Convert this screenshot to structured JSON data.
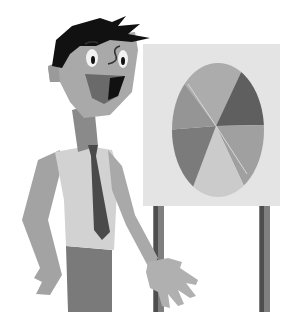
{
  "scene": {
    "description": "Cartoon businessman presenting a pie chart on an easel board",
    "style": "grayscale flat illustration"
  },
  "colors": {
    "background": "#ffffff",
    "hair": "#111111",
    "skin": "#a9a9a9",
    "mouth": "#6a6a6a",
    "tongue": "#8c8c8c",
    "neck": "#8a8a8a",
    "shirt": "#d2d2d2",
    "tie": "#4a4a4a",
    "pants": "#7a7a7a",
    "board": "#e4e4e4",
    "easel_leg": "#7f7f7f",
    "easel_leg_dark": "#4e4e4e"
  },
  "pie": {
    "slices": [
      {
        "name": "top",
        "color": "#acacac"
      },
      {
        "name": "upper-right",
        "color": "#5f5f5f"
      },
      {
        "name": "lower-right",
        "color": "#a0a0a0"
      },
      {
        "name": "bottom",
        "color": "#cbcbcb"
      },
      {
        "name": "lower-left",
        "color": "#7b7b7b"
      },
      {
        "name": "upper-left",
        "color": "#959595"
      }
    ]
  }
}
